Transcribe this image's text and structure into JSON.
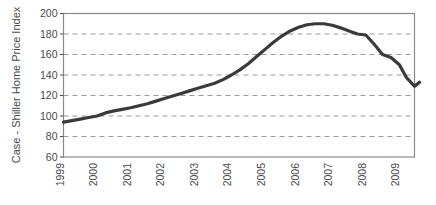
{
  "chart_data": {
    "type": "line",
    "title": "",
    "xlabel": "",
    "ylabel": "Case - Shiller Home Price Index",
    "xlim": [
      1999,
      2009.45
    ],
    "ylim": [
      60,
      200
    ],
    "yticks": [
      60,
      80,
      100,
      120,
      140,
      160,
      180,
      200
    ],
    "xticks": [
      1999,
      2000,
      2001,
      2002,
      2003,
      2004,
      2005,
      2006,
      2007,
      2008,
      2009
    ],
    "xtick_labels": [
      "1999",
      "2000",
      "2001",
      "2002",
      "2003",
      "2004",
      "2005",
      "2006",
      "2007",
      "2008",
      "2009"
    ],
    "ytick_labels": [
      "60",
      "80",
      "100",
      "120",
      "140",
      "160",
      "180",
      "200"
    ],
    "grid": "horizontal-dashed",
    "legend": "none",
    "series": [
      {
        "name": "Case - Shiller Home Price Index",
        "color": "#3a3a3a",
        "line_width": 3.2,
        "x": [
          1999.0,
          1999.25,
          1999.5,
          1999.75,
          2000.0,
          2000.25,
          2000.5,
          2000.75,
          2001.0,
          2001.25,
          2001.5,
          2001.75,
          2002.0,
          2002.25,
          2002.5,
          2002.75,
          2003.0,
          2003.25,
          2003.5,
          2003.75,
          2004.0,
          2004.25,
          2004.5,
          2004.75,
          2005.0,
          2005.25,
          2005.5,
          2005.75,
          2006.0,
          2006.25,
          2006.5,
          2006.75,
          2007.0,
          2007.25,
          2007.5,
          2007.75,
          2008.0,
          2008.25,
          2008.5,
          2008.75,
          2009.0,
          2009.2,
          2009.45
        ],
        "values": [
          94,
          95.5,
          97,
          98.5,
          100,
          103,
          105,
          106.5,
          108,
          110,
          112,
          114.5,
          117,
          119.5,
          122,
          124.5,
          127,
          129.5,
          132,
          135.5,
          140,
          145,
          151,
          158,
          165,
          172,
          178,
          183,
          186.5,
          189,
          190,
          190,
          188.5,
          186,
          183,
          180,
          179,
          170,
          160,
          157,
          150,
          138,
          129
        ]
      }
    ],
    "annotations": []
  },
  "axes": {
    "y_axis_label": "Case - Shiller Home Price Index",
    "frame_color": "#8a8a8a",
    "grid_color": "#9a9a9a",
    "tick_color": "#4a4a4a"
  },
  "tail": {
    "note": "final uptick",
    "x": [
      2009.45,
      2009.6
    ],
    "values": [
      129,
      133
    ]
  }
}
